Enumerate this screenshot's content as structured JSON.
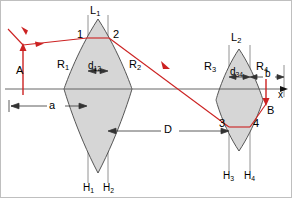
{
  "figure": {
    "background_color": "#ffffff",
    "border_color": "#bfbfbf",
    "ray_color": "#cc2222",
    "glass_fill": "#d6d6d6",
    "glass_stroke": "#444444",
    "guide_color": "#777777",
    "axis_color": "#555555"
  },
  "labels": {
    "lens1_vertex": "L",
    "lens1_vertex_sub": "1",
    "lens2_vertex": "L",
    "lens2_vertex_sub": "2",
    "surface_r1": "R",
    "surface_r1_sub": "1",
    "surface_r2": "R",
    "surface_r2_sub": "2",
    "surface_r3": "R",
    "surface_r3_sub": "3",
    "surface_r4": "R",
    "surface_r4_sub": "4",
    "principal_h1": "H",
    "principal_h1_sub": "1",
    "principal_h2": "H",
    "principal_h2_sub": "2",
    "principal_h3": "H",
    "principal_h3_sub": "3",
    "principal_h4": "H",
    "principal_h4_sub": "4",
    "point1": "1",
    "point2": "2",
    "point3": "3",
    "point4": "4",
    "thickness_d12": "d",
    "thickness_d12_sub": "12",
    "thickness_d34": "d",
    "thickness_d34_sub": "34",
    "object_distance": "a",
    "lens_separation": "D",
    "image_distance": "b",
    "object_point": "A",
    "image_point": "B",
    "axis": "x"
  },
  "geometry": {
    "optical_axis_y": 88,
    "axis_start_x": 4,
    "axis_end_x": 284,
    "lens1": {
      "front_plane_x": 87,
      "back_plane_x": 107,
      "apex_top_y": 18,
      "apex_bottom_y": 172,
      "edge_half_width": 24,
      "point1_xy": [
        86,
        37
      ],
      "point2_xy": [
        108,
        37
      ]
    },
    "lens2": {
      "front_plane_x": 228,
      "back_plane_x": 249,
      "apex_top_y": 48,
      "apex_bottom_y": 150,
      "edge_half_width": 17,
      "point3_xy": [
        228,
        126
      ],
      "point4_xy": [
        249,
        126
      ]
    },
    "dim_a": {
      "y": 105,
      "x_from": 8,
      "x_to": 87
    },
    "dim_D": {
      "y": 130,
      "x_from": 107,
      "x_to": 228
    },
    "dim_b": {
      "y": 76,
      "x_from": 249,
      "x_to": 283
    },
    "dim_d12": {
      "y": 70,
      "x_from": 87,
      "x_to": 107
    },
    "dim_d34": {
      "y": 76,
      "x_from": 228,
      "x_to": 249
    },
    "object_arrow": {
      "x": 22,
      "base_y": 88,
      "tip_y": 43
    },
    "image_arrow": {
      "x": 265,
      "base_y": 88,
      "tip_y": 105
    },
    "incoming_ray_origin": [
      6,
      27
    ]
  }
}
